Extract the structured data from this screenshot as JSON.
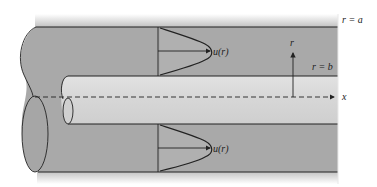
{
  "diagram": {
    "labels": {
      "outer_radius": "r = a",
      "inner_radius": "r = b",
      "radial_axis": "r",
      "axial_axis": "x",
      "velocity_upper": "u(r)",
      "velocity_lower": "u(r)"
    },
    "colors": {
      "outer_fill": "#a9a9a9",
      "inner_fill": "#d8d8d8",
      "stroke": "#222222",
      "background": "#ffffff"
    }
  }
}
